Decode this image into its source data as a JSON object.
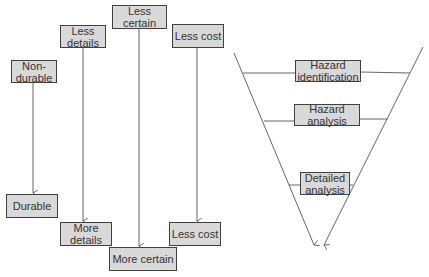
{
  "left_diagram": {
    "columns": [
      {
        "from": "Non-durable",
        "to": "Durable"
      },
      {
        "from": "Less details",
        "to": "More details"
      },
      {
        "from": "Less certain",
        "to": "More certain"
      },
      {
        "from": "Less cost",
        "to": "Less cost"
      }
    ]
  },
  "funnel": {
    "stages": [
      "Hazard identification",
      "Hazard analysis",
      "Detailed analysis"
    ]
  },
  "colors": {
    "box_fill": "#d9d9d9",
    "box_border": "#404040",
    "line": "#555555"
  }
}
